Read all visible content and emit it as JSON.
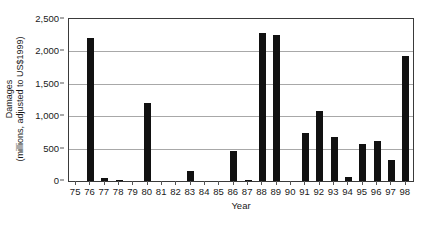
{
  "chart_data": {
    "type": "bar",
    "title": "",
    "xlabel": "Year",
    "ylabel": "Damages (millions, adjusted to US$1999)",
    "ylabel_line1": "Damages",
    "ylabel_line2": "(millions, adjusted to US$1999)",
    "categories": [
      "75",
      "76",
      "77",
      "78",
      "79",
      "80",
      "81",
      "82",
      "83",
      "84",
      "85",
      "86",
      "87",
      "88",
      "89",
      "90",
      "91",
      "92",
      "93",
      "94",
      "95",
      "96",
      "97",
      "98"
    ],
    "values": [
      0,
      2200,
      50,
      20,
      0,
      1210,
      0,
      0,
      150,
      0,
      0,
      460,
      15,
      2280,
      2250,
      0,
      740,
      1080,
      680,
      60,
      570,
      620,
      330,
      1930
    ],
    "ylim": [
      0,
      2500
    ],
    "yticks": [
      0,
      500,
      1000,
      1500,
      2000,
      2500
    ],
    "ytick_labels": [
      "0",
      "500",
      "1,000",
      "1,500",
      "2,000",
      "2,500"
    ],
    "grid": "horizontal",
    "legend": "none",
    "bar_color": "#111111",
    "grid_color": "#a8a8a8",
    "axis_color": "#3a3a3a"
  }
}
